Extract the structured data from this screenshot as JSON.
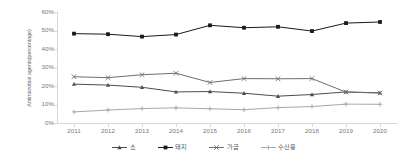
{
  "chart_data": {
    "type": "line",
    "title": "",
    "xlabel": "",
    "ylabel": "Antimicrobial agents(percentage)",
    "categories": [
      "2011",
      "2012",
      "2013",
      "2014",
      "2015",
      "2016",
      "2017",
      "2018",
      "2019",
      "2020"
    ],
    "ylim": [
      0,
      60
    ],
    "ytick_labels": [
      "0%",
      "10%",
      "20%",
      "30%",
      "40%",
      "50%",
      "60%"
    ],
    "ytick_values": [
      0,
      10,
      20,
      30,
      40,
      50,
      60
    ],
    "ytick_suffix": "%",
    "grid": false,
    "legend_position": "bottom",
    "series": [
      {
        "name": "소",
        "marker": "triangle",
        "color": "#4d4d4d",
        "values": [
          21.0,
          20.5,
          19.3,
          16.8,
          17.0,
          16.1,
          14.5,
          15.4,
          16.8,
          16.3
        ]
      },
      {
        "name": "돼지",
        "marker": "square",
        "color": "#1a1a1a",
        "values": [
          48.3,
          48.0,
          46.7,
          47.8,
          52.8,
          51.5,
          52.0,
          49.7,
          54.0,
          54.6
        ]
      },
      {
        "name": "가금",
        "marker": "cross",
        "color": "#6e6e6e",
        "values": [
          25.0,
          24.5,
          26.1,
          26.9,
          21.9,
          24.0,
          23.9,
          24.0,
          16.7,
          16.2
        ]
      },
      {
        "name": "수산용",
        "marker": "plus",
        "color": "#a8a8a8",
        "values": [
          6.0,
          7.0,
          7.8,
          8.2,
          7.7,
          7.2,
          8.3,
          8.9,
          10.2,
          10.1
        ]
      }
    ]
  },
  "legend": {
    "items": [
      {
        "label": "소",
        "marker": "triangle",
        "color": "#4d4d4d"
      },
      {
        "label": "돼지",
        "marker": "square",
        "color": "#1a1a1a"
      },
      {
        "label": "가금",
        "marker": "cross",
        "color": "#6e6e6e"
      },
      {
        "label": "수산용",
        "marker": "plus",
        "color": "#a8a8a8"
      }
    ]
  },
  "axes": {
    "y_title": "Antimicrobial agents(percentage)",
    "axis_color": "#d9d9d9",
    "tick_text_color": "#7a7a7a"
  }
}
